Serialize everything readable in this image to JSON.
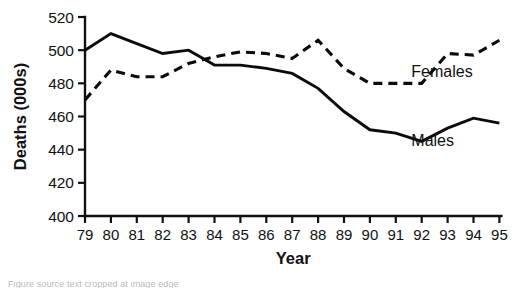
{
  "chart_data": {
    "type": "line",
    "title": "",
    "xlabel": "Year",
    "ylabel": "Deaths (000s)",
    "x": [
      79,
      80,
      81,
      82,
      83,
      84,
      85,
      86,
      87,
      88,
      89,
      90,
      91,
      92,
      93,
      94,
      95
    ],
    "xtick_labels": [
      "79",
      "80",
      "81",
      "82",
      "83",
      "84",
      "85",
      "86",
      "87",
      "88",
      "89",
      "90",
      "91",
      "92",
      "93",
      "94",
      "95"
    ],
    "ytick_labels": [
      "400",
      "420",
      "440",
      "460",
      "480",
      "500",
      "520"
    ],
    "yticks": [
      400,
      420,
      440,
      460,
      480,
      500,
      520
    ],
    "ylim": [
      400,
      520
    ],
    "xlim": [
      79,
      95
    ],
    "grid": false,
    "legend_position": "inline-right",
    "series": [
      {
        "name": "Males",
        "style": "solid",
        "color": "#0b0b0b",
        "label_x": 91.6,
        "label_y": 445,
        "x": [
          79,
          80,
          81,
          82,
          83,
          84,
          85,
          86,
          87,
          88,
          89,
          90,
          91,
          92,
          93,
          94,
          95
        ],
        "values": [
          500,
          510,
          504,
          498,
          500,
          491,
          491,
          489,
          486,
          477,
          463,
          452,
          450,
          445,
          453,
          459,
          456
        ]
      },
      {
        "name": "Females",
        "style": "dashed",
        "color": "#0b0b0b",
        "label_x": 91.6,
        "label_y": 487,
        "x": [
          79,
          80,
          81,
          82,
          83,
          84,
          85,
          86,
          87,
          88,
          89,
          90,
          91,
          92,
          93,
          94,
          95
        ],
        "values": [
          470,
          488,
          484,
          484,
          492,
          496,
          499,
          498,
          495,
          506,
          489,
          480,
          480,
          480,
          498,
          497,
          506
        ]
      }
    ]
  },
  "caption": {
    "sliver_text": "Figure source text cropped at image edge"
  }
}
